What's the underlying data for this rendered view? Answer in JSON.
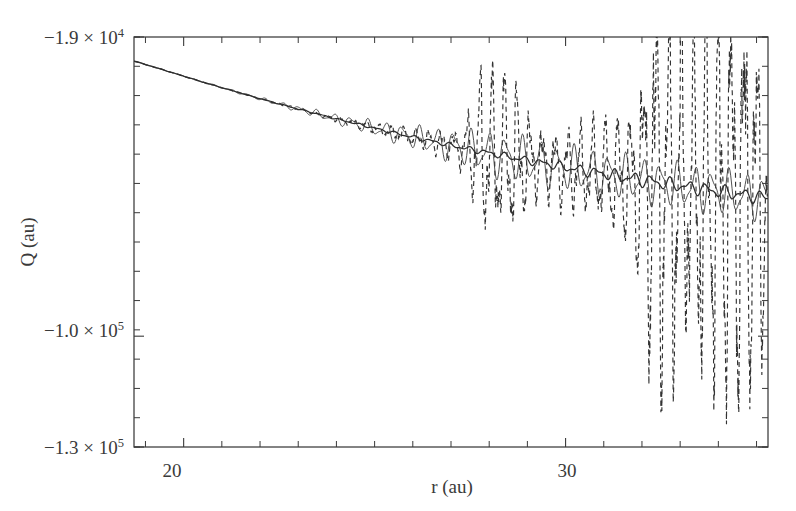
{
  "figure": {
    "background_color": "#ffffff",
    "ink_color": "#2e2e2e",
    "width": 796,
    "height": 511
  },
  "axes": {
    "x_title": "r (au)",
    "y_title": "Q (au)",
    "x_tick_labels": [
      "20",
      "30"
    ],
    "y_tick_labels": [
      {
        "mantissa": "−1.9 × 10",
        "exponent": "4"
      },
      {
        "mantissa": "−1.0 × 10",
        "exponent": "5"
      },
      {
        "mantissa": "−1.3 × 10",
        "exponent": "5"
      }
    ]
  },
  "chart_data": {
    "type": "line",
    "title": "",
    "xlabel": "r (au)",
    "ylabel": "Q (au)",
    "xlim": [
      18.7,
      35.3
    ],
    "ylim": [
      -130000,
      -19000
    ],
    "grid": false,
    "legend": null,
    "y_tick_values": [
      -19000,
      -100000,
      -130000
    ],
    "y_tick_text": [
      "-1.9 x 10^4",
      "-1.0 x 10^5",
      "-1.3 x 10^5"
    ],
    "x_tick_values": [
      20,
      30
    ],
    "x_tick_text": [
      "20",
      "30"
    ],
    "x_minor_tick_step": 1,
    "series": [
      {
        "name": "smooth trend (solid)",
        "style": "solid",
        "comment": "Slowly decreasing mean potential with small-scale ripples that grow mildly with r",
        "x": [
          18.7,
          19.5,
          20.0,
          20.5,
          21.0,
          21.5,
          22.0,
          22.5,
          23.0,
          23.5,
          24.0,
          24.5,
          25.0,
          25.5,
          26.0,
          26.5,
          27.0,
          27.5,
          28.0,
          28.5,
          29.0,
          29.5,
          30.0,
          30.5,
          31.0,
          31.5,
          32.0,
          32.5,
          33.0,
          33.5,
          34.0,
          34.5,
          35.0,
          35.3
        ],
        "y": [
          -25500,
          -28000,
          -29600,
          -31200,
          -32700,
          -34200,
          -35700,
          -37100,
          -38500,
          -39800,
          -41200,
          -42400,
          -43700,
          -44900,
          -46100,
          -47200,
          -48300,
          -49400,
          -50400,
          -51400,
          -52400,
          -53300,
          -54300,
          -55200,
          -56000,
          -56900,
          -57700,
          -58500,
          -59300,
          -60000,
          -60800,
          -61500,
          -62200,
          -62600
        ]
      },
      {
        "name": "oscillating trace (thin solid)",
        "style": "thin-solid",
        "comment": "Quasi-periodic oscillation about the trend, amplitude grows with r",
        "amplitude_at_r19": 200,
        "amplitude_at_r27": 2600,
        "amplitude_at_r35": 6200,
        "oscillation_period_au": 0.45
      },
      {
        "name": "noisy data (dashed)",
        "style": "dashed",
        "comment": "Strongly oscillating dashed curve; amplitude diverges beyond r ~ 26 au producing tall vertical streaks, peaks reaching near -1.25 x 10^5 around r = 32.6 and r = 33.9",
        "amplitude_at_r20": 150,
        "amplitude_at_r26": 4000,
        "amplitude_at_r28": 17000,
        "amplitude_at_r32_6": 62000,
        "amplitude_at_r33_9": 58000,
        "oscillation_period_au": 0.33,
        "envelope_peaks_r": [
          27.9,
          28.6,
          32.6,
          33.9,
          34.8
        ],
        "envelope_peaks_amplitude": [
          21000,
          17000,
          62000,
          56000,
          34000
        ]
      }
    ]
  }
}
